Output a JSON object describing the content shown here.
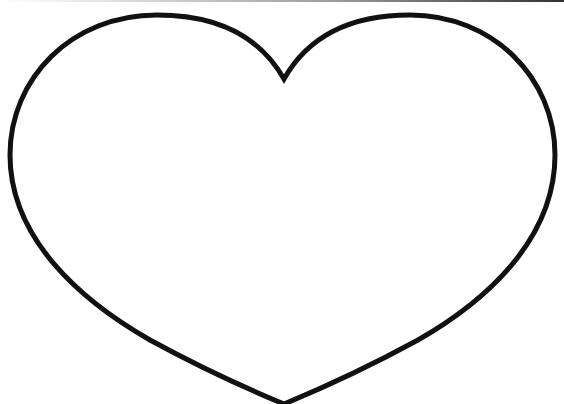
{
  "image": {
    "subject": "heart outline",
    "background_color": "#ffffff",
    "stroke_color": "#111111",
    "stroke_width": 5,
    "top_edge_gradient": [
      "#ffffff",
      "#303030"
    ]
  },
  "heart": {
    "label": "heart-outline",
    "notch": {
      "x": 284,
      "y": 80
    },
    "tip": {
      "x": 284,
      "y": 404
    },
    "left_extreme": {
      "x": 9,
      "y": 150
    },
    "right_extreme": {
      "x": 554,
      "y": 150
    },
    "left_lobe_top": {
      "x": 155,
      "y": 15
    },
    "right_lobe_top": {
      "x": 410,
      "y": 15
    }
  }
}
